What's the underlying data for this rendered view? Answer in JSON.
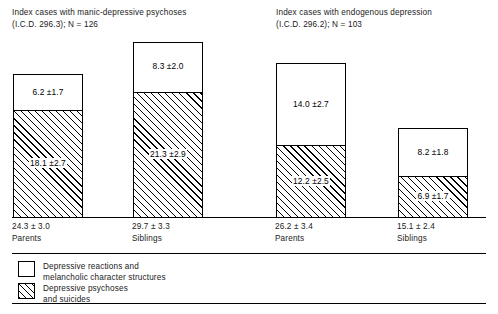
{
  "panels": [
    {
      "id": "manic-depressive",
      "title": "Index cases with manic-depressive psychoses\n(I.C.D. 296.3); N = 126"
    },
    {
      "id": "endogenous-depression",
      "title": "Index cases with endogenous depression\n(I.C.D. 296.2); N = 103"
    }
  ],
  "legend": [
    {
      "key": "reactions",
      "swatch": "white",
      "label": "Depressive reactions and\nmelancholic character structures"
    },
    {
      "key": "psychoses",
      "swatch": "hatched",
      "label": "Depressive psychoses\nand suicides"
    }
  ],
  "bars": [
    {
      "group": "manic-depressive",
      "category": "Parents",
      "total_label": "24.3 ± 3.0",
      "total_value": 24.3,
      "top_label": "6.2 ±1.7",
      "top_value": 6.2,
      "bottom_label": "18.1 ±2.7",
      "bottom_value": 18.1
    },
    {
      "group": "manic-depressive",
      "category": "Siblings",
      "total_label": "29.7 ± 3.3",
      "total_value": 29.7,
      "top_label": "8.3 ±2.0",
      "top_value": 8.3,
      "bottom_label": "21.3 ±2.9",
      "bottom_value": 21.3
    },
    {
      "group": "endogenous-depression",
      "category": "Parents",
      "total_label": "26.2 ± 3.4",
      "total_value": 26.2,
      "top_label": "14.0 ±2.7",
      "top_value": 14.0,
      "bottom_label": "12.2 ±2.5",
      "bottom_value": 12.2
    },
    {
      "group": "endogenous-depression",
      "category": "Siblings",
      "total_label": "15.1 ± 2.4",
      "total_value": 15.1,
      "top_label": "8.2 ±1.8",
      "top_value": 8.2,
      "bottom_label": "6.9 ±1.7",
      "bottom_value": 6.9
    }
  ],
  "chart_data": {
    "type": "bar",
    "subtitle": "",
    "stacked": true,
    "xlabel": "",
    "ylabel": "",
    "ylim": [
      0,
      30
    ],
    "grid": false,
    "legend_position": "bottom-left",
    "categories": [
      "Parents (manic-depressive psychoses)",
      "Siblings (manic-depressive psychoses)",
      "Parents (endogenous depression)",
      "Siblings (endogenous depression)"
    ],
    "series": [
      {
        "name": "Depressive psychoses and suicides",
        "values": [
          18.1,
          21.3,
          12.2,
          6.9
        ],
        "errors": [
          2.7,
          2.9,
          2.5,
          1.7
        ],
        "fill": "hatched"
      },
      {
        "name": "Depressive reactions and melancholic character structures",
        "values": [
          6.2,
          8.3,
          14.0,
          8.2
        ],
        "errors": [
          1.7,
          2.0,
          2.7,
          1.8
        ],
        "fill": "white"
      }
    ],
    "totals": [
      24.3,
      29.7,
      26.2,
      15.1
    ],
    "total_errors": [
      3.0,
      3.3,
      3.4,
      2.4
    ],
    "annotations": [
      "Index cases with manic-depressive psychoses (I.C.D. 296.3); N = 126",
      "Index cases with endogenous depression (I.C.D. 296.2); N = 103"
    ]
  },
  "geometry": {
    "baseline_y": 217,
    "px_per_unit": 5.885,
    "bar_width": 70,
    "bar_lefts": [
      13,
      133,
      276,
      398
    ],
    "label_lefts": [
      12,
      132,
      275,
      397
    ]
  },
  "colors": {
    "ink": "#000000",
    "text": "#1a1a1a",
    "background": "#ffffff"
  }
}
